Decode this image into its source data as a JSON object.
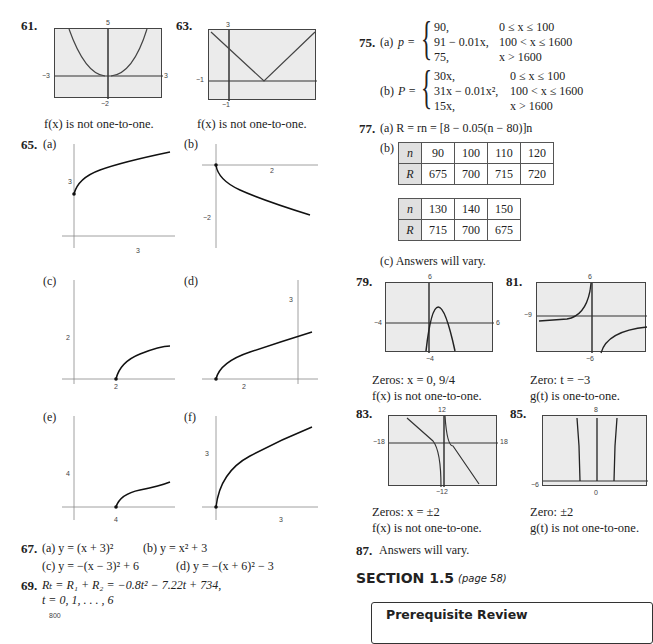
{
  "left_column": {
    "p61": {
      "number": "61.",
      "window": {
        "ymax": "5",
        "ymin": "−2",
        "xmin": "−3",
        "xmax": "3"
      },
      "caption": "f(x) is not one-to-one."
    },
    "p63": {
      "number": "63.",
      "window": {
        "ymax": "3",
        "ymin": "−1",
        "xmin": "−1",
        "xmax": "5"
      },
      "caption": "f(x) is not one-to-one."
    },
    "p65": {
      "number": "65.",
      "parts": [
        {
          "label": "(a)",
          "ytick": "3",
          "xtick": "3"
        },
        {
          "label": "(b)",
          "ytick": "−2",
          "xtick": "2"
        },
        {
          "label": "(c)",
          "ytick": "2",
          "xtick": "2"
        },
        {
          "label": "(d)",
          "ytick": "3",
          "xtick": "2"
        },
        {
          "label": "(e)",
          "ytick": "4",
          "xtick": "4"
        },
        {
          "label": "(f)",
          "ytick": "3",
          "xtick": "3"
        }
      ],
      "axis_x": "x",
      "axis_y": "y"
    },
    "p67": {
      "number": "67.",
      "a": "(a)  y = (x + 3)²",
      "b": "(b)  y = x² + 3",
      "c": "(c)  y = −(x − 3)² + 6",
      "d": "(d)  y = −(x + 6)² − 3"
    },
    "p69": {
      "number": "69.",
      "line1": "Rₜ = R₁ + R₂ = −0.8t² − 7.22t + 734,",
      "line2": "t = 0, 1, . . . , 6",
      "graph_tick": "800"
    }
  },
  "right_column": {
    "p75": {
      "number": "75.",
      "a_label": "(a)",
      "a_lhs": "p =",
      "a_rows": [
        {
          "expr": "90,",
          "cond": "0 ≤ x ≤ 100"
        },
        {
          "expr": "91 − 0.01x,",
          "cond": "100 < x ≤ 1600"
        },
        {
          "expr": "75,",
          "cond": "x > 1600"
        }
      ],
      "b_label": "(b)",
      "b_lhs": "P =",
      "b_rows": [
        {
          "expr": "30x,",
          "cond": "0 ≤ x ≤ 100"
        },
        {
          "expr": "31x − 0.01x²,",
          "cond": "100 < x ≤ 1600"
        },
        {
          "expr": "15x,",
          "cond": "x > 1600"
        }
      ]
    },
    "p77": {
      "number": "77.",
      "a": "(a)  R = rn = [8 − 0.05(n − 80)]n",
      "b_label": "(b)",
      "table1": {
        "n_label": "n",
        "r_label": "R",
        "n": [
          "90",
          "100",
          "110",
          "120"
        ],
        "R": [
          "675",
          "700",
          "715",
          "720"
        ]
      },
      "table2": {
        "n_label": "n",
        "r_label": "R",
        "n": [
          "130",
          "140",
          "150"
        ],
        "R": [
          "715",
          "700",
          "675"
        ]
      },
      "c": "(c)  Answers will vary."
    },
    "p79": {
      "number": "79.",
      "window": {
        "ymax": "6",
        "ymin": "−4",
        "xmin": "−4",
        "xmax": "6"
      },
      "caption1": "Zeros:  x = 0, 9/4",
      "caption2": "f(x) is not one-to-one."
    },
    "p81": {
      "number": "81.",
      "window": {
        "ymax": "6",
        "ymin": "−6",
        "xmin": "−9"
      },
      "caption1": "Zero:  t = −3",
      "caption2": "g(t) is one-to-one."
    },
    "p83": {
      "number": "83.",
      "window": {
        "ymax": "12",
        "ymin": "−12",
        "xmin": "−18",
        "xmax": "18"
      },
      "caption1": "Zeros:  x = ±2",
      "caption2": "f(x) is not one-to-one."
    },
    "p85": {
      "number": "85.",
      "window": {
        "ymax": "8",
        "ymin": "0",
        "xmin": "−6"
      },
      "caption1": "Zero:  ±2",
      "caption2": "g(t) is not one-to-one."
    },
    "p87": {
      "number": "87.",
      "text": "Answers will vary."
    },
    "section": {
      "title": "SECTION 1.5",
      "page": "(page 58)"
    },
    "prereq_title": "Prerequisite Review"
  }
}
